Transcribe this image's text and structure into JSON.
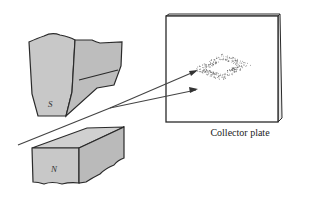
{
  "diagram": {
    "magnet_south_label": "S",
    "magnet_north_label": "N",
    "collector_label": "Collector plate",
    "colors": {
      "magnet_fill": "#c8c8c8",
      "magnet_fill_dark": "#b8b8b8",
      "outline": "#2a2a2a",
      "plate_fill": "#ffffff",
      "beam": "#444444",
      "deposit": "#555555"
    }
  }
}
